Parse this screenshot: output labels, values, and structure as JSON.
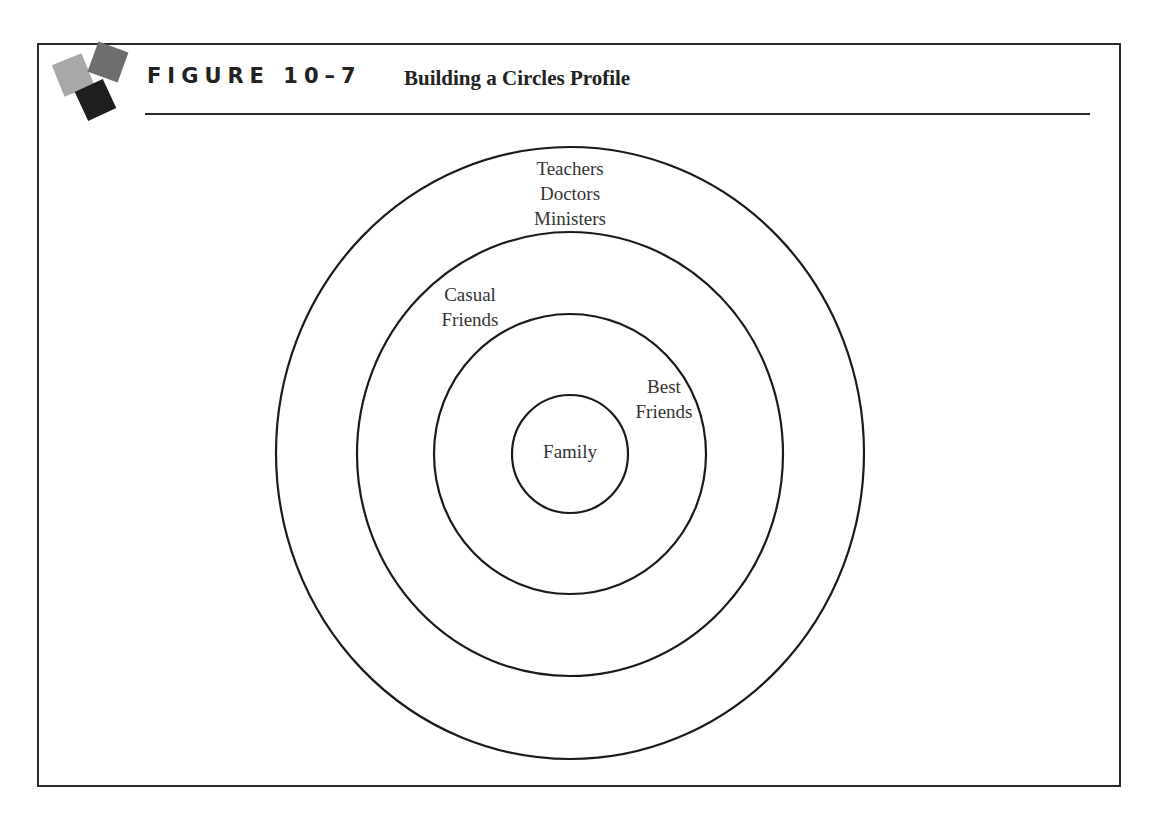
{
  "header": {
    "figure_label": "FIGURE 10–7",
    "title": "Building a Circles Profile"
  },
  "diagram": {
    "type": "concentric-circles",
    "stroke_color": "#1a1a1a",
    "rings": [
      {
        "name": "outer",
        "label": "Teachers\nDoctors\nMinisters",
        "cx": 570,
        "cy": 453,
        "rx": 294,
        "ry": 306
      },
      {
        "name": "second",
        "label": "Casual\nFriends",
        "cx": 570,
        "cy": 454,
        "rx": 213,
        "ry": 222
      },
      {
        "name": "third",
        "label": "Best\nFriends",
        "cx": 570,
        "cy": 454,
        "rx": 136,
        "ry": 140
      },
      {
        "name": "inner",
        "label": "Family",
        "cx": 570,
        "cy": 454,
        "rx": 58,
        "ry": 59
      }
    ]
  }
}
